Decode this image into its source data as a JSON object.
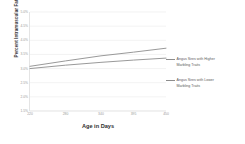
{
  "chart_data": {
    "type": "line",
    "title": "",
    "xlabel": "Age in Days",
    "ylabel": "Percent Intramuscular Fat",
    "x": [
      220,
      280,
      340,
      395,
      450
    ],
    "xlim": [
      220,
      450
    ],
    "ylim": [
      1.5,
      5.0
    ],
    "xticks": [
      "220",
      "280",
      "340",
      "395",
      "450"
    ],
    "yticks": [
      "5.0%",
      "4.5%",
      "4.0%",
      "3.5%",
      "3.0%",
      "2.5%",
      "2.0%",
      "1.5%"
    ],
    "ytick_values": [
      5.0,
      4.5,
      4.0,
      3.5,
      3.0,
      2.5,
      2.0,
      1.5
    ],
    "grid": true,
    "grid_axis": "y",
    "legend_position": "right",
    "series": [
      {
        "name": "Angus Sires with Higher Marbling Traits",
        "values": [
          3.08,
          3.27,
          3.45,
          3.58,
          3.72
        ],
        "color": "#8d8d8d"
      },
      {
        "name": "Angus Sires with Lower Marbling Traits",
        "values": [
          3.0,
          3.12,
          3.22,
          3.3,
          3.37
        ],
        "color": "#8d8d8d"
      }
    ]
  },
  "legend": {
    "entries": [
      {
        "line1": "Angus Sires with Higher",
        "line2": "Marbling Traits"
      },
      {
        "line1": "Angus Sires with Lower",
        "line2": "Marbling Traits"
      }
    ]
  },
  "colors": {
    "line": "#8d8d8d",
    "grid": "#ededed",
    "axis": "#d8d8d8",
    "tick_text": "#9a9a9a",
    "title_text": "#2e2e2e",
    "background": "#ffffff"
  }
}
